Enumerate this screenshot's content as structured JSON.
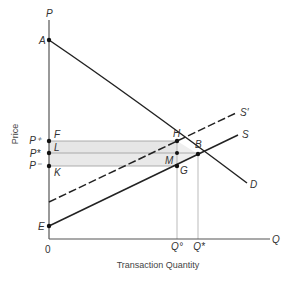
{
  "diagram": {
    "axis": {
      "y_symbol": "P",
      "x_symbol": "Q",
      "origin": "0",
      "y_title": "Price",
      "x_title": "Transaction Quantity"
    },
    "curves": {
      "demand": "D",
      "supply": "S",
      "supply_shifted": "S′"
    },
    "points": {
      "A": "A",
      "E": "E",
      "F": "F",
      "L": "L",
      "K": "K",
      "H": "H",
      "B": "B",
      "M": "M",
      "G": "G"
    },
    "price_levels": {
      "p_plus": "P⁺",
      "p_star": "P*",
      "p_minus": "P⁻"
    },
    "quantity_levels": {
      "q_circle": "Q°",
      "q_star": "Q*"
    },
    "colors": {
      "line": "#222222",
      "axis": "#555555",
      "shade": "#e6e6e6",
      "guide": "#aaaaaa"
    }
  }
}
